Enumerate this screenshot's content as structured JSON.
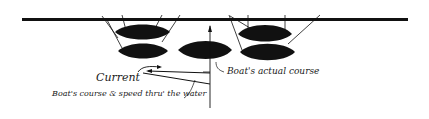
{
  "diagram": {
    "labels": {
      "current": "Current",
      "actual_course": "Boat's actual course",
      "course_through_water": "Boat's course & speed thru' the water"
    },
    "elements": [
      "dock",
      "moored-boats-left",
      "moored-boats-right",
      "approaching-boat",
      "current-arrow",
      "course-vector",
      "actual-course-arrow"
    ],
    "colors": {
      "ink": "#111111",
      "background": "#ffffff"
    }
  }
}
